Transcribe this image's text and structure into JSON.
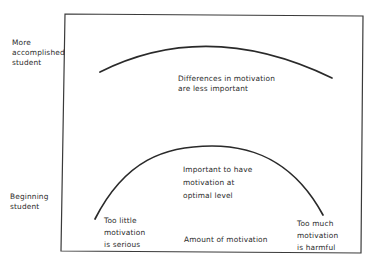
{
  "diagram": {
    "type": "motivation-vs-performance-curves",
    "y_axis": {
      "top_label": [
        "More",
        "accomplished",
        "student"
      ],
      "bottom_label": [
        "Beginning",
        "student"
      ]
    },
    "x_axis": {
      "label": "Amount of motivation"
    },
    "curves": [
      {
        "name": "more-accomplished-student-curve",
        "shape": "shallow inverted U",
        "annotation": [
          "Differences in motivation",
          "are less important"
        ]
      },
      {
        "name": "beginning-student-curve",
        "shape": "steep inverted U",
        "annotation": [
          "Important to have",
          "motivation at",
          "optimal level"
        ],
        "left_note": [
          "Too little",
          "motivation",
          "is serious"
        ],
        "right_note": [
          "Too much",
          "motivation",
          "is harmful"
        ]
      }
    ],
    "colors": {
      "line": "#2a2a2a",
      "frame": "#3a3a3a",
      "background": "#ffffff"
    }
  }
}
